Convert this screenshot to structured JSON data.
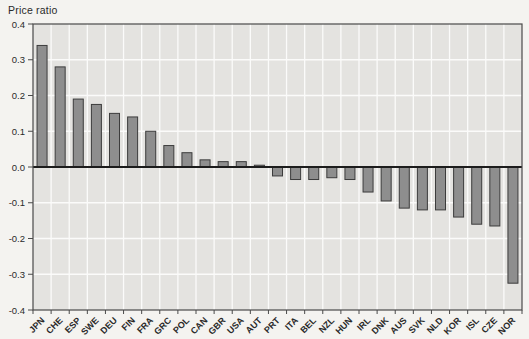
{
  "chart_data": {
    "type": "bar",
    "title": "",
    "ylabel": "Price ratio",
    "xlabel": "",
    "categories": [
      "JPN",
      "CHE",
      "ESP",
      "SWE",
      "DEU",
      "FIN",
      "FRA",
      "GRC",
      "POL",
      "CAN",
      "GBR",
      "USA",
      "AUT",
      "PRT",
      "ITA",
      "BEL",
      "NZL",
      "HUN",
      "IRL",
      "DNK",
      "AUS",
      "SVK",
      "NLD",
      "KOR",
      "ISL",
      "CZE",
      "NOR"
    ],
    "values": [
      0.34,
      0.28,
      0.19,
      0.175,
      0.15,
      0.14,
      0.1,
      0.06,
      0.04,
      0.02,
      0.015,
      0.015,
      0.005,
      -0.025,
      -0.035,
      -0.035,
      -0.03,
      -0.035,
      -0.07,
      -0.095,
      -0.115,
      -0.12,
      -0.12,
      -0.14,
      -0.16,
      -0.165,
      -0.325
    ],
    "ylim": [
      -0.4,
      0.4
    ],
    "ytick_step": 0.1,
    "ytick_labels": [
      "0.4",
      "0.3",
      "0.2",
      "0.1",
      "0.0",
      "-0.1",
      "-0.2",
      "-0.3",
      "-0.4"
    ],
    "grid": true,
    "legend_position": "none",
    "colors": {
      "page_bg": "#f4f3f0",
      "plot_bg": "#e4e3e0",
      "grid": "#fbfbfa",
      "bar_fill": "#8e8e8e",
      "bar_stroke": "#3c3c3c",
      "axis": "#4a4a4a",
      "zero_line": "#1c1c1c",
      "text": "#2a2a2a"
    }
  }
}
